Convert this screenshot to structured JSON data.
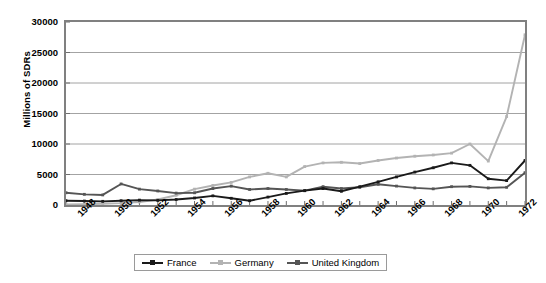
{
  "chart_data": {
    "type": "line",
    "title": "",
    "xlabel": "",
    "ylabel": "Millions of SDRs",
    "xlim": [
      1948,
      1973
    ],
    "ylim": [
      0,
      30000
    ],
    "yticks": [
      0,
      5000,
      10000,
      15000,
      20000,
      25000,
      30000
    ],
    "ytick_labels": [
      "0",
      "5000",
      "10000",
      "15000",
      "20000",
      "25000",
      "30000"
    ],
    "xticks": [
      1948,
      1950,
      1952,
      1954,
      1956,
      1958,
      1960,
      1962,
      1964,
      1966,
      1968,
      1970,
      1972
    ],
    "xtick_labels": [
      "1948",
      "1950",
      "1952",
      "1954",
      "1956",
      "1958",
      "1960",
      "1962",
      "1964",
      "1966",
      "1968",
      "1970",
      "1972"
    ],
    "x": [
      1948,
      1949,
      1950,
      1951,
      1952,
      1953,
      1954,
      1955,
      1956,
      1957,
      1958,
      1959,
      1960,
      1961,
      1962,
      1963,
      1964,
      1965,
      1966,
      1967,
      1968,
      1969,
      1970,
      1971,
      1972,
      1973
    ],
    "grid": true,
    "legend_position": "bottom",
    "series": [
      {
        "name": "France",
        "color": "#1a1a1a",
        "values": [
          700,
          650,
          600,
          700,
          800,
          750,
          900,
          1150,
          1500,
          1100,
          700,
          1300,
          1900,
          2350,
          2700,
          2250,
          3000,
          3800,
          4600,
          5400,
          6100,
          6900,
          6500,
          4300,
          4000,
          7300
        ]
      },
      {
        "name": "Germany",
        "color": "#b3b3b3",
        "values": [
          100,
          120,
          200,
          300,
          500,
          900,
          1600,
          2600,
          3200,
          3700,
          4600,
          5200,
          4600,
          6300,
          6900,
          7000,
          6800,
          7300,
          7700,
          8000,
          8200,
          8500,
          10000,
          7200,
          14500,
          27900
        ]
      },
      {
        "name": "United Kingdom",
        "color": "#555555",
        "values": [
          2000,
          1750,
          1650,
          3450,
          2600,
          2300,
          1950,
          2000,
          2700,
          3100,
          2550,
          2700,
          2550,
          2350,
          3000,
          2700,
          2900,
          3400,
          3100,
          2800,
          2650,
          3000,
          3050,
          2800,
          2900,
          5300
        ]
      }
    ]
  },
  "legend": {
    "items": [
      {
        "label": "France",
        "color": "#1a1a1a"
      },
      {
        "label": "Germany",
        "color": "#b3b3b3"
      },
      {
        "label": "United Kingdom",
        "color": "#555555"
      }
    ]
  }
}
